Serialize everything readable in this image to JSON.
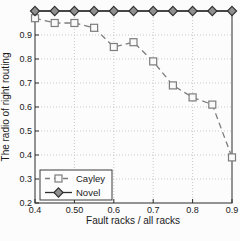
{
  "page": {
    "background": "#fcfcfc"
  },
  "chart_data": {
    "type": "line",
    "title": "",
    "xlabel": "Fault racks / all racks",
    "ylabel": "The radio of right routing",
    "xlim": [
      0.4,
      0.9
    ],
    "ylim": [
      0.2,
      1.0
    ],
    "x": [
      0.4,
      0.45,
      0.5,
      0.55,
      0.6,
      0.65,
      0.7,
      0.75,
      0.8,
      0.85,
      0.9
    ],
    "series": [
      {
        "name": "Cayley",
        "values": [
          0.97,
          0.95,
          0.95,
          0.93,
          0.85,
          0.87,
          0.79,
          0.69,
          0.64,
          0.61,
          0.39
        ],
        "color": "#7d7d7d",
        "line_style": "dashed",
        "marker": "square",
        "marker_fill": "#fafafa"
      },
      {
        "name": "Novel",
        "values": [
          1.0,
          1.0,
          1.0,
          1.0,
          1.0,
          1.0,
          1.0,
          1.0,
          1.0,
          1.0,
          1.0
        ],
        "color": "#2e2e2e",
        "line_style": "solid",
        "marker": "diamond",
        "marker_fill": "#8f8f8f"
      }
    ],
    "x_ticks": {
      "values": [
        0.4,
        0.5,
        0.6,
        0.7,
        0.8,
        0.9
      ],
      "labels": [
        "0.4",
        "0.50",
        "0.6",
        "0.7",
        "0.8",
        "0.9"
      ]
    },
    "y_ticks": {
      "values": [
        0.2,
        0.3,
        0.4,
        0.5,
        0.6,
        0.7,
        0.8,
        0.9
      ],
      "labels": [
        "0.2",
        "0.3",
        "0.4",
        "0.5",
        "0.6",
        "0.7",
        "0.8",
        "0.9"
      ]
    },
    "grid": "dotted",
    "grid_color": "#c9c9c9",
    "axis_color": "#2b2b2b",
    "text_color": "#1a1a1a",
    "legend": {
      "position": "lower-left",
      "entries": [
        "Cayley",
        "Novel"
      ]
    }
  }
}
